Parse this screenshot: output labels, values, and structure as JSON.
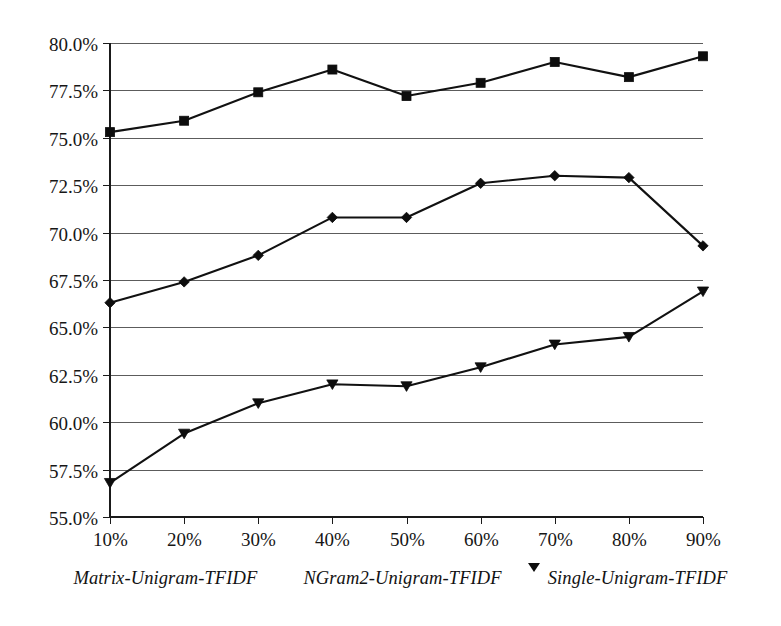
{
  "chart_data": {
    "type": "line",
    "title": "",
    "subtitle": "",
    "xlabel": "",
    "ylabel": "",
    "grid": true,
    "legend_position": "bottom",
    "x": [
      "10%",
      "20%",
      "30%",
      "40%",
      "50%",
      "60%",
      "70%",
      "80%",
      "90%"
    ],
    "categories": [
      "10%",
      "20%",
      "30%",
      "40%",
      "50%",
      "60%",
      "70%",
      "80%",
      "90%"
    ],
    "xtick_labels": [
      "10%",
      "20%",
      "30%",
      "40%",
      "50%",
      "60%",
      "70%",
      "80%",
      "90%"
    ],
    "ytick_labels": [
      "55.0%",
      "57.5%",
      "60.0%",
      "62.5%",
      "65.0%",
      "67.5%",
      "70.0%",
      "72.5%",
      "75.0%",
      "77.5%",
      "80.0%"
    ],
    "ytick_values": [
      55.0,
      57.5,
      60.0,
      62.5,
      65.0,
      67.5,
      70.0,
      72.5,
      75.0,
      77.5,
      80.0
    ],
    "ylim": [
      55.0,
      80.0
    ],
    "series": [
      {
        "name": "Matrix-Unigram-TFIDF",
        "marker": "square",
        "values": [
          75.3,
          75.9,
          77.4,
          78.6,
          77.2,
          77.9,
          79.0,
          78.2,
          79.3
        ]
      },
      {
        "name": "NGram2-Unigram-TFIDF",
        "marker": "diamond",
        "values": [
          66.3,
          67.4,
          68.8,
          70.8,
          70.8,
          72.6,
          73.0,
          72.9,
          69.3
        ]
      },
      {
        "name": "Single-Unigram-TFIDF",
        "marker": "triangle-down",
        "values": [
          56.8,
          59.4,
          61.0,
          62.0,
          61.9,
          62.9,
          64.1,
          64.5,
          66.9
        ]
      }
    ]
  },
  "legend": {
    "entries": [
      {
        "label": "Matrix-Unigram-TFIDF",
        "marker": "square"
      },
      {
        "label": "NGram2-Unigram-TFIDF",
        "marker": "diamond"
      },
      {
        "label": "Single-Unigram-TFIDF",
        "marker": "triangle-down"
      }
    ]
  },
  "colors": {
    "line": "#111111",
    "marker": "#0d0d0d",
    "grid": "#5c5c5c",
    "axis": "#1a1a1a",
    "text": "#161616",
    "background": "#ffffff"
  }
}
